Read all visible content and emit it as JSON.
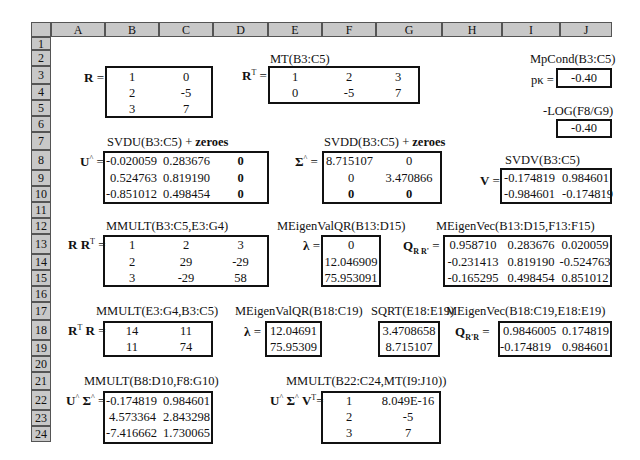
{
  "grid": {
    "columns": [
      "A",
      "B",
      "C",
      "D",
      "E",
      "F",
      "G",
      "H",
      "I",
      "J"
    ],
    "rows": [
      "1",
      "2",
      "3",
      "4",
      "5",
      "6",
      "7",
      "8",
      "9",
      "10",
      "11",
      "12",
      "13",
      "14",
      "15",
      "16",
      "17",
      "18",
      "19",
      "20",
      "21",
      "22",
      "23",
      "24"
    ]
  },
  "blocks": {
    "R": {
      "symbol": "R",
      "rows": [
        [
          "1",
          "0"
        ],
        [
          "2",
          "-5"
        ],
        [
          "3",
          "7"
        ]
      ]
    },
    "RT": {
      "formula": "MT(B3:C5)",
      "symbol": "R",
      "sup": "T",
      "rows": [
        [
          "1",
          "2",
          "3"
        ],
        [
          "0",
          "-5",
          "7"
        ]
      ]
    },
    "mpcond": {
      "formula": "MpCond(B3:C5)",
      "symbol": "pκ =",
      "value": "-0.40"
    },
    "neglog": {
      "formula": "-LOG(F8/G9)",
      "value": "-0.40"
    },
    "U": {
      "formula_prefix": "SVDU(B3:C5) + ",
      "formula_bold": "zeroes",
      "symbol": "U",
      "sup": "^",
      "rows": [
        [
          "-0.020059",
          "0.283676",
          "0"
        ],
        [
          "0.524763",
          "0.819190",
          "0"
        ],
        [
          "-0.851012",
          "0.498454",
          "0"
        ]
      ]
    },
    "Sigma": {
      "formula_prefix": "SVDD(B3:C5) + ",
      "formula_bold": "zeroes",
      "symbol": "Σ",
      "sup": "^",
      "rows": [
        [
          "8.715107",
          "0"
        ],
        [
          "0",
          "3.470866"
        ],
        [
          "0",
          "0"
        ]
      ]
    },
    "V": {
      "formula": "SVDV(B3:C5)",
      "symbol": "V",
      "rows": [
        [
          "-0.174819",
          "0.984601"
        ],
        [
          "-0.984601",
          "-0.174819"
        ]
      ]
    },
    "RRT": {
      "formula": "MMULT(B3:C5,E3:G4)",
      "symbol": "R R",
      "sup": "T",
      "rows": [
        [
          "1",
          "2",
          "3"
        ],
        [
          "2",
          "29",
          "-29"
        ],
        [
          "3",
          "-29",
          "58"
        ]
      ]
    },
    "lambda1": {
      "formula": "MEigenValQR(B13:D15)",
      "symbol": "λ",
      "rows": [
        [
          "0"
        ],
        [
          "12.046909"
        ],
        [
          "75.953091"
        ]
      ]
    },
    "QRRT": {
      "formula": "MEigenVec(B13:D15,F13:F15)",
      "symbol": "Q",
      "sub": "R R'",
      "rows": [
        [
          "0.958710",
          "0.283676",
          "0.020059"
        ],
        [
          "-0.231413",
          "0.819190",
          "-0.524763"
        ],
        [
          "-0.165295",
          "0.498454",
          "0.851012"
        ]
      ]
    },
    "RTR": {
      "formula": "MMULT(E3:G4,B3:C5)",
      "symbol": "R",
      "sup": "T",
      "symbol2": " R",
      "rows": [
        [
          "14",
          "11"
        ],
        [
          "11",
          "74"
        ]
      ]
    },
    "lambda2": {
      "formula": "MEigenValQR(B18:C19)",
      "symbol": "λ",
      "rows": [
        [
          "12.04691"
        ],
        [
          "75.95309"
        ]
      ]
    },
    "sqrt": {
      "formula": "SQRT(E18:E19)",
      "rows": [
        [
          "3.4708658"
        ],
        [
          "8.715107"
        ]
      ]
    },
    "QRTR": {
      "formula": "MEigenVec(B18:C19,E18:E19)",
      "symbol": "Q",
      "sub": "R'R",
      "rows": [
        [
          "0.9846005",
          "0.174819"
        ],
        [
          "-0.174819",
          "0.984601"
        ]
      ]
    },
    "USigma": {
      "formula": "MMULT(B8:D10,F8:G10)",
      "symbol": "U",
      "sup": "^",
      "symbol2": " Σ",
      "sup2": "^",
      "rows": [
        [
          "-0.174819",
          "0.984601"
        ],
        [
          "4.573364",
          "2.843298"
        ],
        [
          "-7.416662",
          "1.730065"
        ]
      ]
    },
    "USigmaVT": {
      "formula": "MMULT(B22:C24,MT(I9:J10))",
      "symbol": "U",
      "sup": "^",
      "symbol2": " Σ",
      "sup2": "^",
      "symbol3": " V",
      "sup3": "T",
      "rows": [
        [
          "1",
          "8.049E-16"
        ],
        [
          "2",
          "-5"
        ],
        [
          "3",
          "7"
        ]
      ]
    }
  },
  "equals": "="
}
